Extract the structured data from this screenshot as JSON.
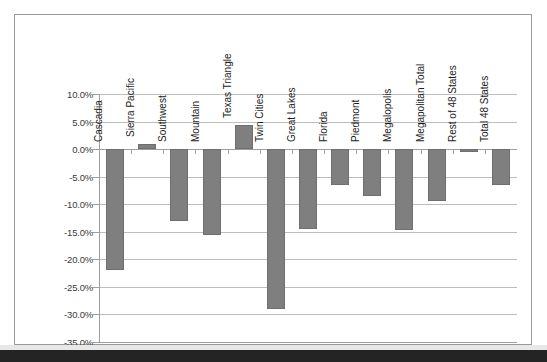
{
  "chart_data": {
    "type": "bar",
    "title": "",
    "subtitle": "",
    "xlabel": "",
    "ylabel": "",
    "ylim": [
      -35,
      10
    ],
    "ytick_step": 5,
    "grid": true,
    "legend": "none",
    "orientation": "vertical",
    "bar_color": "#7f7f7f",
    "categories": [
      "Cascadia",
      "Sierra Pacific",
      "Southwest",
      "Mountain",
      "Texas Triangle",
      "Twin Cities",
      "Great Lakes",
      "Florida",
      "Piedmont",
      "Megalopolis",
      "Megapolitan Total",
      "Rest of 48 States",
      "Total 48 States"
    ],
    "values": [
      -22.0,
      1.0,
      -13.0,
      -15.5,
      4.4,
      -29.0,
      -14.5,
      -6.5,
      -8.5,
      -14.6,
      -9.5,
      -0.6,
      -6.5
    ],
    "ytick_labels": [
      "10.0%",
      "5.0%",
      "0.0%",
      "-5.0%",
      "-10.0%",
      "-15.0%",
      "-20.0%",
      "-25.0%",
      "-30.0%",
      "-35.0%"
    ],
    "ytick_values": [
      10,
      5,
      0,
      -5,
      -10,
      -15,
      -20,
      -25,
      -30,
      -35
    ]
  }
}
